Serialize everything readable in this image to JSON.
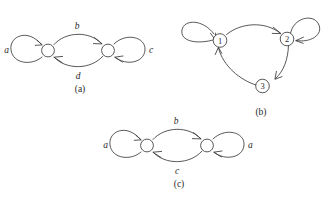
{
  "figure": {
    "background_color": "#ffffff",
    "ink_color": "#3a3a3a",
    "panels": [
      {
        "id": "a",
        "caption": "(a)",
        "nodes": [
          {
            "id": "a-left",
            "label": ""
          },
          {
            "id": "a-right",
            "label": ""
          }
        ],
        "edges": [
          {
            "id": "a-loop-left",
            "label": "a",
            "kind": "self-loop",
            "from": "a-left",
            "to": "a-left"
          },
          {
            "id": "a-arc-top",
            "label": "b",
            "kind": "arc",
            "from": "a-left",
            "to": "a-right"
          },
          {
            "id": "a-arc-bottom",
            "label": "d",
            "kind": "arc",
            "from": "a-right",
            "to": "a-left"
          },
          {
            "id": "a-loop-right",
            "label": "c",
            "kind": "self-loop",
            "from": "a-right",
            "to": "a-right"
          }
        ]
      },
      {
        "id": "b",
        "caption": "(b)",
        "nodes": [
          {
            "id": "b-1",
            "label": "1"
          },
          {
            "id": "b-2",
            "label": "2"
          },
          {
            "id": "b-3",
            "label": "3"
          }
        ],
        "edges": [
          {
            "id": "b-loop-1",
            "label": "",
            "kind": "self-loop",
            "from": "b-1",
            "to": "b-1"
          },
          {
            "id": "b-arc-1-2",
            "label": "",
            "kind": "arc",
            "from": "b-1",
            "to": "b-2"
          },
          {
            "id": "b-loop-2",
            "label": "",
            "kind": "self-loop",
            "from": "b-2",
            "to": "b-2"
          },
          {
            "id": "b-arc-2-3",
            "label": "",
            "kind": "arc",
            "from": "b-2",
            "to": "b-3"
          },
          {
            "id": "b-arc-3-1",
            "label": "",
            "kind": "arc",
            "from": "b-3",
            "to": "b-1"
          }
        ]
      },
      {
        "id": "c",
        "caption": "(c)",
        "nodes": [
          {
            "id": "c-left",
            "label": ""
          },
          {
            "id": "c-right",
            "label": ""
          }
        ],
        "edges": [
          {
            "id": "c-loop-left",
            "label": "a",
            "kind": "self-loop",
            "from": "c-left",
            "to": "c-left"
          },
          {
            "id": "c-arc-top",
            "label": "b",
            "kind": "arc",
            "from": "c-left",
            "to": "c-right"
          },
          {
            "id": "c-arc-bottom",
            "label": "c",
            "kind": "arc",
            "from": "c-right",
            "to": "c-left"
          },
          {
            "id": "c-loop-right",
            "label": "a",
            "kind": "self-loop",
            "from": "c-right",
            "to": "c-right"
          }
        ]
      }
    ]
  }
}
